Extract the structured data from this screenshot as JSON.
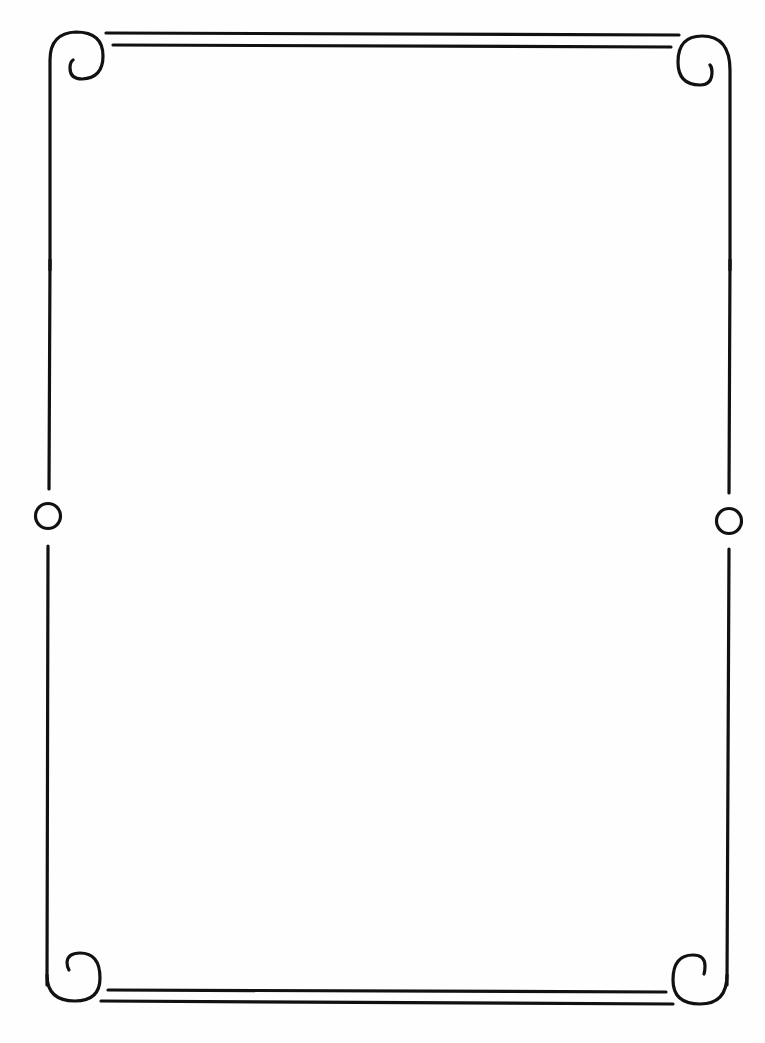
{
  "page": {
    "type": "decorative-border-frame",
    "background_color": "#ffffff",
    "stroke_color": "#111111",
    "ornaments": {
      "corners": [
        "top-left-scroll",
        "top-right-scroll",
        "bottom-left-scroll",
        "bottom-right-scroll"
      ],
      "side_medallions": [
        "left-ring",
        "right-ring"
      ],
      "edge_rules": [
        "top-double-rule",
        "bottom-double-rule",
        "left-rule",
        "right-rule"
      ]
    },
    "content_text": ""
  }
}
